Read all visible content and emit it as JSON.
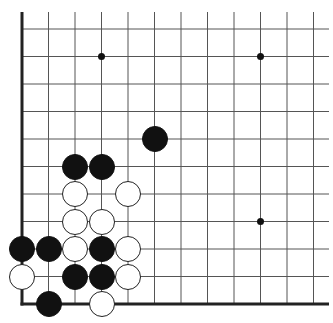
{
  "board": {
    "description": "Go board corner (lower-left), 12 columns x 11 rows visible",
    "line_color": "#555555",
    "border_color": "#222222",
    "black_color": "#111111",
    "white_color": "#ffffff",
    "grid": {
      "x": [
        22,
        48.5,
        75,
        101.5,
        128,
        154.5,
        181,
        207.5,
        234,
        260.5,
        287,
        313.5
      ],
      "y": [
        29,
        56.5,
        84,
        111.5,
        139,
        166.5,
        194,
        221.5,
        249,
        276.5,
        304
      ],
      "line_top": 12,
      "line_right": 329,
      "left_edge_col": 0,
      "bottom_edge_row": 10
    },
    "star_points": [
      {
        "col": 3,
        "row": 1
      },
      {
        "col": 9,
        "row": 1
      },
      {
        "col": 9,
        "row": 7
      }
    ],
    "stones": [
      {
        "color": "black",
        "col": 5,
        "row": 4
      },
      {
        "color": "black",
        "col": 2,
        "row": 5
      },
      {
        "color": "black",
        "col": 3,
        "row": 5
      },
      {
        "color": "white",
        "col": 2,
        "row": 6
      },
      {
        "color": "white",
        "col": 4,
        "row": 6
      },
      {
        "color": "white",
        "col": 2,
        "row": 7
      },
      {
        "color": "white",
        "col": 3,
        "row": 7
      },
      {
        "color": "black",
        "col": 0,
        "row": 8
      },
      {
        "color": "black",
        "col": 1,
        "row": 8
      },
      {
        "color": "white",
        "col": 2,
        "row": 8
      },
      {
        "color": "black",
        "col": 3,
        "row": 8
      },
      {
        "color": "white",
        "col": 4,
        "row": 8
      },
      {
        "color": "white",
        "col": 0,
        "row": 9
      },
      {
        "color": "black",
        "col": 2,
        "row": 9
      },
      {
        "color": "black",
        "col": 3,
        "row": 9
      },
      {
        "color": "white",
        "col": 4,
        "row": 9
      },
      {
        "color": "black",
        "col": 1,
        "row": 10
      },
      {
        "color": "white",
        "col": 3,
        "row": 10
      }
    ],
    "counts": {
      "black": 9,
      "white": 9
    }
  }
}
